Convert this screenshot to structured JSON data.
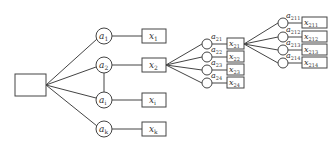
{
  "diagram": {
    "type": "tree",
    "root": {
      "label": ""
    },
    "level1": {
      "attributes": [
        {
          "base": "a",
          "sub": "1"
        },
        {
          "base": "a",
          "sub": "2"
        },
        {
          "base": "a",
          "sub": "i"
        },
        {
          "base": "a",
          "sub": "k"
        }
      ],
      "values": [
        {
          "base": "x",
          "sub": "1"
        },
        {
          "base": "x",
          "sub": "2"
        },
        {
          "base": "x",
          "sub": "i"
        },
        {
          "base": "x",
          "sub": "k"
        }
      ]
    },
    "level2": {
      "parent": "x2",
      "attributes": [
        {
          "base": "a",
          "sub": "21"
        },
        {
          "base": "a",
          "sub": "22"
        },
        {
          "base": "a",
          "sub": "23"
        },
        {
          "base": "a",
          "sub": "24"
        }
      ],
      "values": [
        {
          "base": "x",
          "sub": "21"
        },
        {
          "base": "x",
          "sub": "22"
        },
        {
          "base": "x",
          "sub": "23"
        },
        {
          "base": "x",
          "sub": "24"
        }
      ]
    },
    "level3": {
      "parent": "x21",
      "attributes": [
        {
          "base": "a",
          "sub": "211"
        },
        {
          "base": "a",
          "sub": "212"
        },
        {
          "base": "a",
          "sub": "213"
        },
        {
          "base": "a",
          "sub": "214"
        }
      ],
      "values": [
        {
          "base": "x",
          "sub": "211"
        },
        {
          "base": "x",
          "sub": "212"
        },
        {
          "base": "x",
          "sub": "213"
        },
        {
          "base": "x",
          "sub": "214"
        }
      ]
    },
    "colors": {
      "stroke": "#444444",
      "background": "#ffffff"
    }
  }
}
